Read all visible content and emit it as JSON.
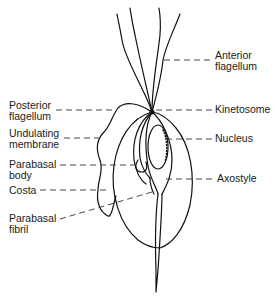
{
  "diagram": {
    "labels": {
      "anterior_flagellum": [
        "Anterior",
        "flagellum"
      ],
      "posterior_flagellum": [
        "Posterior",
        "flagellum"
      ],
      "kinetosome": [
        "Kinetosome"
      ],
      "undulating_membrane": [
        "Undulating",
        "membrane"
      ],
      "nucleus": [
        "Nucleus"
      ],
      "parabasal_body": [
        "Parabasal",
        "body"
      ],
      "axostyle": [
        "Axostyle"
      ],
      "costa": [
        "Costa"
      ],
      "parabasal_fibril": [
        "Parabasal",
        "fibril"
      ]
    },
    "colors": {
      "line": "#111111",
      "background": "#ffffff"
    }
  }
}
